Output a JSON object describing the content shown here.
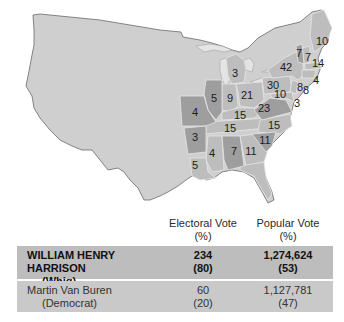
{
  "map": {
    "colors": {
      "west": "#cfcfcf",
      "harrison_states": "#bdbdbd",
      "van_buren_states": "#9e9e9e",
      "outline": "#6a6a6a",
      "state_border": "#e6e6e6"
    },
    "states": [
      {
        "abbr": "ME",
        "electoral_votes": "10",
        "winner": "Harrison"
      },
      {
        "abbr": "NH",
        "electoral_votes": "7",
        "winner": "Van Buren"
      },
      {
        "abbr": "VT",
        "electoral_votes": "7",
        "winner": "Harrison"
      },
      {
        "abbr": "MA",
        "electoral_votes": "14",
        "winner": "Harrison"
      },
      {
        "abbr": "NY",
        "electoral_votes": "42",
        "winner": "Harrison"
      },
      {
        "abbr": "RI",
        "electoral_votes": "4",
        "winner": "Harrison"
      },
      {
        "abbr": "CT",
        "electoral_votes": "8",
        "winner": "Harrison"
      },
      {
        "abbr": "NJ",
        "electoral_votes": "8",
        "winner": "Harrison"
      },
      {
        "abbr": "PA",
        "electoral_votes": "30",
        "winner": "Harrison"
      },
      {
        "abbr": "MD",
        "electoral_votes": "10",
        "winner": "Harrison"
      },
      {
        "abbr": "DE",
        "electoral_votes": "3",
        "winner": "Harrison"
      },
      {
        "abbr": "MI",
        "electoral_votes": "3",
        "winner": "Harrison"
      },
      {
        "abbr": "IL",
        "electoral_votes": "5",
        "winner": "Van Buren"
      },
      {
        "abbr": "IN",
        "electoral_votes": "9",
        "winner": "Harrison"
      },
      {
        "abbr": "OH",
        "electoral_votes": "21",
        "winner": "Harrison"
      },
      {
        "abbr": "MO",
        "electoral_votes": "4",
        "winner": "Van Buren"
      },
      {
        "abbr": "KY",
        "electoral_votes": "15",
        "winner": "Harrison"
      },
      {
        "abbr": "VA",
        "electoral_votes": "23",
        "winner": "Van Buren"
      },
      {
        "abbr": "TN",
        "electoral_votes": "15",
        "winner": "Harrison"
      },
      {
        "abbr": "NC",
        "electoral_votes": "15",
        "winner": "Harrison"
      },
      {
        "abbr": "AR",
        "electoral_votes": "3",
        "winner": "Van Buren"
      },
      {
        "abbr": "SC",
        "electoral_votes": "11",
        "winner": "Van Buren"
      },
      {
        "abbr": "MS",
        "electoral_votes": "4",
        "winner": "Harrison"
      },
      {
        "abbr": "AL",
        "electoral_votes": "7",
        "winner": "Van Buren"
      },
      {
        "abbr": "GA",
        "electoral_votes": "11",
        "winner": "Harrison"
      },
      {
        "abbr": "LA",
        "electoral_votes": "5",
        "winner": "Harrison"
      }
    ]
  },
  "table": {
    "headers": {
      "electoral": "Electoral Vote",
      "electoral_unit": "(%)",
      "popular": "Popular Vote",
      "popular_unit": "(%)"
    },
    "rows": [
      {
        "candidate": "WILLIAM HENRY HARRISON",
        "party": "(Whig)",
        "electoral_vote": "234",
        "electoral_pct": "(80)",
        "popular_vote": "1,274,624",
        "popular_pct": "(53)"
      },
      {
        "candidate": "Martin Van Buren",
        "party": "(Democrat)",
        "electoral_vote": "60",
        "electoral_pct": "(20)",
        "popular_vote": "1,127,781",
        "popular_pct": "(47)"
      }
    ]
  }
}
